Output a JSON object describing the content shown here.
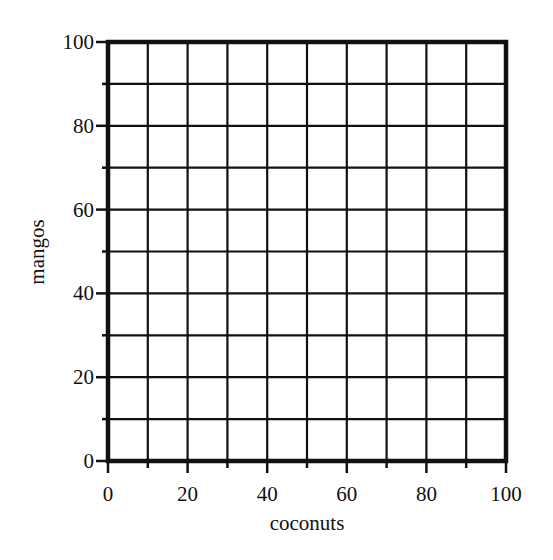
{
  "chart_data": {
    "type": "scatter",
    "title": "",
    "xlabel": "coconuts",
    "ylabel": "mangos",
    "xlim": [
      0,
      100
    ],
    "ylim": [
      0,
      100
    ],
    "x_ticks": [
      0,
      20,
      40,
      60,
      80,
      100
    ],
    "y_ticks": [
      0,
      20,
      40,
      60,
      80,
      100
    ],
    "x_tick_labels": [
      "0",
      "20",
      "40",
      "60",
      "80",
      "100"
    ],
    "y_tick_labels": [
      "0",
      "20",
      "40",
      "60",
      "80",
      "100"
    ],
    "grid": true,
    "grid_step": 10,
    "series": [],
    "legend": null
  },
  "colors": {
    "grid": "#111111",
    "background": "#ffffff"
  }
}
